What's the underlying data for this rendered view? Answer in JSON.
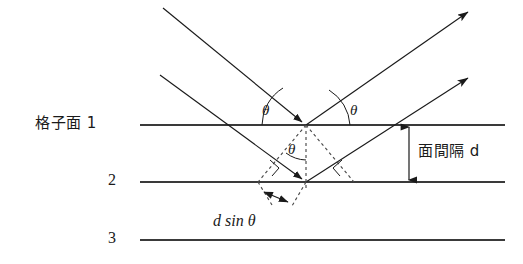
{
  "figure": {
    "title_semantic": "bragg-diffraction-diagram",
    "background_color": "#ffffff",
    "line_color": "#1a1a1a",
    "plane_color": "#3a3a3a",
    "dotted_color": "#4a4a4a"
  },
  "labels": {
    "plane1": "格子面 1",
    "plane2": "2",
    "plane3": "3",
    "spacing": "面間隔 d",
    "path_difference": "d sin θ",
    "theta_incident": "θ",
    "theta_reflected": "θ",
    "theta_lower": "θ"
  },
  "planes": [
    {
      "name": "lattice-plane-1",
      "label": "格子面 1",
      "y": 125,
      "x1": 140,
      "x2": 505
    },
    {
      "name": "lattice-plane-2",
      "label": "2",
      "y": 182,
      "x1": 140,
      "x2": 505
    },
    {
      "name": "lattice-plane-3",
      "label": "3",
      "y": 240,
      "x1": 140,
      "x2": 505
    }
  ],
  "geometry": {
    "interplanar_spacing_d": "d",
    "path_difference_expression": "d sin θ",
    "angle_symbol": "θ",
    "incidence_point_plane1": {
      "x": 306,
      "y": 125
    },
    "incidence_point_plane2": {
      "x": 306,
      "y": 182
    },
    "dimension_arrow_x": 409,
    "right_angle_markers": 2,
    "angle_arcs": 3
  },
  "rays": {
    "incoming": [
      {
        "name": "incident-ray-upper",
        "from": {
          "x": 163,
          "y": 8
        },
        "to": {
          "x": 306,
          "y": 125
        }
      },
      {
        "name": "incident-ray-lower",
        "from": {
          "x": 160,
          "y": 75
        },
        "to": {
          "x": 306,
          "y": 182
        }
      }
    ],
    "outgoing": [
      {
        "name": "reflected-ray-upper",
        "from": {
          "x": 306,
          "y": 125
        },
        "to": {
          "x": 468,
          "y": 12
        }
      },
      {
        "name": "reflected-ray-lower",
        "from": {
          "x": 306,
          "y": 182
        },
        "to": {
          "x": 468,
          "y": 78
        }
      }
    ]
  }
}
